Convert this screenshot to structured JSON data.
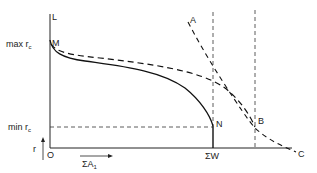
{
  "diagram": {
    "y_axis": {
      "top_label": "L",
      "arrow_label": "r"
    },
    "x_axis": {
      "origin_label": "O",
      "arrow_label_main": "ΣA",
      "arrow_label_sub": "1",
      "end_label": "ΣW"
    },
    "y_ticks": {
      "max": {
        "prefix": "max r",
        "sub": "c"
      },
      "min": {
        "prefix": "min r",
        "sub": "c"
      }
    },
    "points": {
      "M": "M",
      "N": "N",
      "A": "A",
      "B": "B",
      "C": "C"
    }
  }
}
